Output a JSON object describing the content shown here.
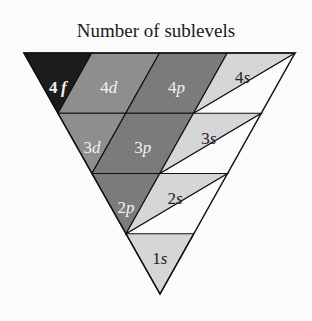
{
  "title": "Number of sublevels",
  "colors": {
    "f": "#1c1c1c",
    "d": "#8e8e8e",
    "p": "#7b7b7b",
    "s": "#d6d6d6",
    "outline": "#111111",
    "label_light": "#f2f2f2",
    "label_dark": "#222222"
  },
  "rows": [
    {
      "level": 4,
      "cells": [
        {
          "id": "4f",
          "num": "4",
          "sub": "f",
          "type": "f"
        },
        {
          "id": "4d",
          "num": "4",
          "sub": "d",
          "type": "d"
        },
        {
          "id": "4p",
          "num": "4",
          "sub": "p",
          "type": "p"
        },
        {
          "id": "4s",
          "num": "4",
          "sub": "s",
          "type": "s"
        }
      ]
    },
    {
      "level": 3,
      "cells": [
        {
          "id": "3d",
          "num": "3",
          "sub": "d",
          "type": "d"
        },
        {
          "id": "3p",
          "num": "3",
          "sub": "p",
          "type": "p"
        },
        {
          "id": "3s",
          "num": "3",
          "sub": "s",
          "type": "s"
        }
      ]
    },
    {
      "level": 2,
      "cells": [
        {
          "id": "2p",
          "num": "2",
          "sub": "p",
          "type": "p"
        },
        {
          "id": "2s",
          "num": "2",
          "sub": "s",
          "type": "s"
        }
      ]
    },
    {
      "level": 1,
      "cells": [
        {
          "id": "1s",
          "num": "1",
          "sub": "s",
          "type": "s"
        }
      ]
    }
  ]
}
